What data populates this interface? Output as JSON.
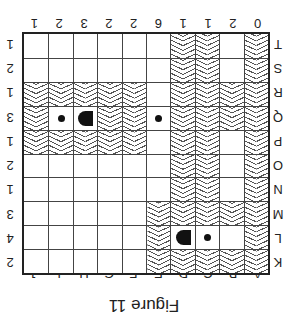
{
  "figure": {
    "title": "Figure 11",
    "orientation_degrees": 180,
    "column_labels": [
      "A",
      "B",
      "C",
      "D",
      "E",
      "F",
      "G",
      "H",
      "I",
      "J"
    ],
    "row_labels": [
      "K",
      "L",
      "M",
      "N",
      "O",
      "P",
      "Q",
      "R",
      "S",
      "T"
    ],
    "column_counts": [
      "0",
      "2",
      "1",
      "1",
      "6",
      "2",
      "2",
      "3",
      "2",
      "1"
    ],
    "row_counts": [
      "2",
      "4",
      "3",
      "1",
      "2",
      "1",
      "3",
      "1",
      "2",
      "1"
    ],
    "legend": {
      "wave": "wavy-hatched cell",
      "dot": "small dot",
      "d": "D-shaped marker"
    },
    "grid": [
      [
        "w",
        "w",
        "w",
        "w",
        "w",
        "",
        "",
        "",
        "",
        ""
      ],
      [
        "w",
        "",
        "dot",
        "d",
        "w",
        "",
        "",
        "",
        "",
        ""
      ],
      [
        "w",
        "w",
        "w",
        "w",
        "w",
        "",
        "",
        "",
        "",
        ""
      ],
      [
        "w",
        "",
        "w",
        "w",
        "",
        "",
        "",
        "",
        "",
        ""
      ],
      [
        "w",
        "",
        "w",
        "w",
        "",
        "",
        "",
        "",
        "",
        ""
      ],
      [
        "w",
        "",
        "w",
        "w",
        "",
        "w",
        "w",
        "w",
        "w",
        "w"
      ],
      [
        "w",
        "w",
        "w",
        "w",
        "dot",
        "w",
        "w",
        "d",
        "dot",
        "w"
      ],
      [
        "w",
        "w",
        "w",
        "w",
        "",
        "w",
        "w",
        "w",
        "w",
        "w"
      ],
      [
        "w",
        "",
        "w",
        "w",
        "",
        "",
        "",
        "",
        "",
        ""
      ],
      [
        "w",
        "",
        "w",
        "w",
        "",
        "",
        "",
        "",
        "",
        ""
      ]
    ]
  }
}
